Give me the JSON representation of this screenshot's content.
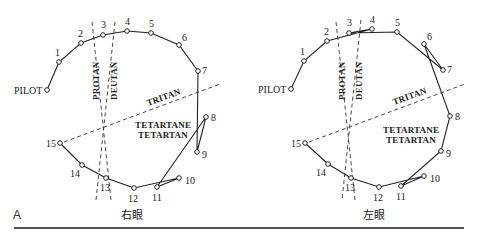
{
  "figure": {
    "panel_label": "A",
    "test_name": "Farnsworth D-15 (Panel D-15) arrangement",
    "panels": [
      {
        "id": "right-eye",
        "eye_label": "右眼",
        "offset_x": 0,
        "pilot": {
          "label": "PILOT",
          "x": 47,
          "y": 90
        },
        "caps": [
          {
            "n": "1",
            "x": 59,
            "y": 62
          },
          {
            "n": "2",
            "x": 81,
            "y": 43
          },
          {
            "n": "3",
            "x": 103,
            "y": 35
          },
          {
            "n": "4",
            "x": 127,
            "y": 31
          },
          {
            "n": "5",
            "x": 151,
            "y": 33
          },
          {
            "n": "6",
            "x": 179,
            "y": 45
          },
          {
            "n": "7",
            "x": 198,
            "y": 71
          },
          {
            "n": "8",
            "x": 206,
            "y": 117
          },
          {
            "n": "9",
            "x": 197,
            "y": 152
          },
          {
            "n": "10",
            "x": 179,
            "y": 178
          },
          {
            "n": "11",
            "x": 157,
            "y": 187
          },
          {
            "n": "12",
            "x": 134,
            "y": 188
          },
          {
            "n": "13",
            "x": 106,
            "y": 178
          },
          {
            "n": "14",
            "x": 82,
            "y": 165
          },
          {
            "n": "15",
            "x": 60,
            "y": 143
          }
        ],
        "order": [
          "PILOT",
          "1",
          "2",
          "3",
          "4",
          "5",
          "6",
          "7",
          "9",
          "8",
          "11",
          "10",
          "12",
          "13",
          "14",
          "15"
        ]
      },
      {
        "id": "left-eye",
        "eye_label": "左眼",
        "offset_x": 0,
        "pilot": {
          "label": "PILOT",
          "x": 291,
          "y": 89
        },
        "caps": [
          {
            "n": "1",
            "x": 304,
            "y": 61
          },
          {
            "n": "2",
            "x": 327,
            "y": 41
          },
          {
            "n": "3",
            "x": 349,
            "y": 33
          },
          {
            "n": "4",
            "x": 372,
            "y": 29
          },
          {
            "n": "5",
            "x": 397,
            "y": 32
          },
          {
            "n": "6",
            "x": 424,
            "y": 44
          },
          {
            "n": "7",
            "x": 443,
            "y": 70
          },
          {
            "n": "8",
            "x": 450,
            "y": 116
          },
          {
            "n": "9",
            "x": 441,
            "y": 151
          },
          {
            "n": "10",
            "x": 424,
            "y": 176
          },
          {
            "n": "11",
            "x": 401,
            "y": 186
          },
          {
            "n": "12",
            "x": 379,
            "y": 187
          },
          {
            "n": "13",
            "x": 351,
            "y": 178
          },
          {
            "n": "14",
            "x": 328,
            "y": 164
          },
          {
            "n": "15",
            "x": 305,
            "y": 143
          }
        ],
        "order": [
          "PILOT",
          "1",
          "2",
          "4",
          "3",
          "5",
          "7",
          "6",
          "8",
          "9",
          "11",
          "10",
          "12",
          "13",
          "14",
          "15"
        ]
      }
    ],
    "confusion_axes": {
      "protan": "PROTAN",
      "deutan": "DEUTAN",
      "tritan": "TRITAN",
      "tetartan_line1": "TETARTANE",
      "tetartan_line2": "TETARTAN"
    }
  }
}
